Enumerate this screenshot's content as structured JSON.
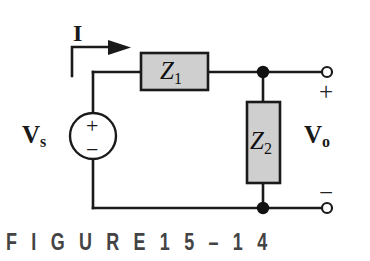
{
  "figure": {
    "caption": "F I G U R E     1 5 – 1 4",
    "caption_label": "FIGURE 15-14",
    "background_color": "#ffffff",
    "wire_color": "#1a1a1a",
    "box_fill_color": "#cfcfcf",
    "box_border_color": "#1a1a1a",
    "caption_color": "#444444"
  },
  "labels": {
    "current": "I",
    "source_name": "V",
    "source_subscript": "s",
    "output_name": "V",
    "output_subscript": "o",
    "impedance_1_symbol": "Z",
    "impedance_1_subscript": "1",
    "impedance_2_symbol": "Z",
    "impedance_2_subscript": "2"
  },
  "signs": {
    "source_plus": "+",
    "source_minus": "−",
    "terminal_plus": "+",
    "terminal_minus": "−"
  },
  "components": {
    "voltage_source": {
      "name": "Vs",
      "type": "independent-voltage-source",
      "center_x": 93,
      "center_y": 136,
      "radius": 23
    },
    "series_impedance": {
      "name": "Z1",
      "type": "impedance-box",
      "orientation": "horizontal",
      "x": 141,
      "y": 53,
      "width": 67,
      "height": 37
    },
    "shunt_impedance": {
      "name": "Z2",
      "type": "impedance-box",
      "orientation": "vertical",
      "x": 247,
      "y": 102,
      "width": 33,
      "height": 81
    },
    "output_terminal_top": {
      "type": "open-terminal",
      "cx": 327,
      "cy": 72,
      "r": 5
    },
    "output_terminal_bottom": {
      "type": "open-terminal",
      "cx": 327,
      "cy": 208,
      "r": 5
    },
    "node_top": {
      "cx": 263,
      "cy": 72,
      "r": 6
    },
    "node_bottom": {
      "cx": 263,
      "cy": 208,
      "r": 6
    }
  }
}
